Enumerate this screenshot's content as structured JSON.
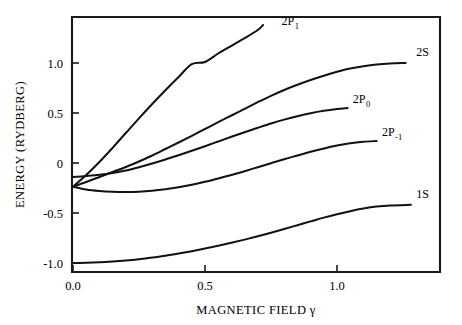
{
  "chart_data": {
    "type": "line",
    "title": "",
    "xlabel": "MAGNETIC FIELD  γ",
    "ylabel": "ENERGY (RYDBERG)",
    "xlim": [
      -0.03,
      1.39
    ],
    "ylim": [
      -1.09,
      1.47
    ],
    "xticks": [
      0.0,
      0.5,
      1.0
    ],
    "xtick_labels": [
      "0.0",
      "0.5",
      "1.0"
    ],
    "yticks": [
      -1.0,
      -0.5,
      0,
      0.5,
      1.0
    ],
    "ytick_labels": [
      "-1.0",
      "-0.5",
      "0",
      "0.5",
      "1.0"
    ],
    "grid": false,
    "legend": "none",
    "annotations": [
      {
        "text": "2P",
        "sub": "1",
        "x": 0.79,
        "y": 1.38
      },
      {
        "text": "2S",
        "sub": "",
        "x": 1.3,
        "y": 1.07
      },
      {
        "text": "2P",
        "sub": "0",
        "x": 1.06,
        "y": 0.6
      },
      {
        "text": "2P",
        "sub": "-1",
        "x": 1.17,
        "y": 0.27
      },
      {
        "text": "1S",
        "sub": "",
        "x": 1.3,
        "y": -0.35
      }
    ],
    "series": [
      {
        "name": "2P1",
        "label": "2P₁",
        "points": [
          [
            0.0,
            -0.237
          ],
          [
            0.05,
            -0.12
          ],
          [
            0.1,
            0.01
          ],
          [
            0.15,
            0.152
          ],
          [
            0.2,
            0.3
          ],
          [
            0.25,
            0.447
          ],
          [
            0.3,
            0.59
          ],
          [
            0.35,
            0.728
          ],
          [
            0.4,
            0.86
          ],
          [
            0.45,
            0.988
          ],
          [
            0.5,
            1.01
          ],
          [
            0.55,
            1.095
          ],
          [
            0.6,
            1.172
          ],
          [
            0.65,
            1.248
          ],
          [
            0.7,
            1.33
          ],
          [
            0.72,
            1.38
          ]
        ]
      },
      {
        "name": "2S",
        "label": "2S",
        "points": [
          [
            0.0,
            -0.237
          ],
          [
            0.05,
            -0.19
          ],
          [
            0.1,
            -0.14
          ],
          [
            0.15,
            -0.09
          ],
          [
            0.2,
            -0.04
          ],
          [
            0.25,
            0.015
          ],
          [
            0.3,
            0.075
          ],
          [
            0.35,
            0.14
          ],
          [
            0.4,
            0.205
          ],
          [
            0.45,
            0.272
          ],
          [
            0.5,
            0.34
          ],
          [
            0.55,
            0.408
          ],
          [
            0.6,
            0.475
          ],
          [
            0.65,
            0.542
          ],
          [
            0.7,
            0.608
          ],
          [
            0.75,
            0.672
          ],
          [
            0.8,
            0.73
          ],
          [
            0.85,
            0.782
          ],
          [
            0.9,
            0.83
          ],
          [
            0.95,
            0.873
          ],
          [
            1.0,
            0.912
          ],
          [
            1.05,
            0.945
          ],
          [
            1.1,
            0.968
          ],
          [
            1.15,
            0.985
          ],
          [
            1.2,
            0.995
          ],
          [
            1.26,
            1.0
          ]
        ]
      },
      {
        "name": "2P0",
        "label": "2P₀",
        "points": [
          [
            0.0,
            -0.14
          ],
          [
            0.05,
            -0.13
          ],
          [
            0.1,
            -0.118
          ],
          [
            0.15,
            -0.1
          ],
          [
            0.2,
            -0.075
          ],
          [
            0.25,
            -0.042
          ],
          [
            0.3,
            -0.005
          ],
          [
            0.35,
            0.035
          ],
          [
            0.4,
            0.078
          ],
          [
            0.45,
            0.122
          ],
          [
            0.5,
            0.168
          ],
          [
            0.55,
            0.215
          ],
          [
            0.6,
            0.262
          ],
          [
            0.65,
            0.308
          ],
          [
            0.7,
            0.352
          ],
          [
            0.75,
            0.395
          ],
          [
            0.8,
            0.434
          ],
          [
            0.85,
            0.468
          ],
          [
            0.9,
            0.498
          ],
          [
            0.95,
            0.522
          ],
          [
            1.0,
            0.54
          ],
          [
            1.04,
            0.55
          ]
        ]
      },
      {
        "name": "2P-1",
        "label": "2P₋₁",
        "points": [
          [
            0.0,
            -0.237
          ],
          [
            0.05,
            -0.265
          ],
          [
            0.1,
            -0.28
          ],
          [
            0.15,
            -0.288
          ],
          [
            0.2,
            -0.29
          ],
          [
            0.25,
            -0.287
          ],
          [
            0.3,
            -0.278
          ],
          [
            0.35,
            -0.263
          ],
          [
            0.4,
            -0.243
          ],
          [
            0.45,
            -0.218
          ],
          [
            0.5,
            -0.188
          ],
          [
            0.55,
            -0.155
          ],
          [
            0.6,
            -0.12
          ],
          [
            0.65,
            -0.082
          ],
          [
            0.7,
            -0.042
          ],
          [
            0.75,
            -0.002
          ],
          [
            0.8,
            0.038
          ],
          [
            0.85,
            0.075
          ],
          [
            0.9,
            0.112
          ],
          [
            0.95,
            0.145
          ],
          [
            1.0,
            0.175
          ],
          [
            1.05,
            0.198
          ],
          [
            1.1,
            0.212
          ],
          [
            1.15,
            0.22
          ]
        ]
      },
      {
        "name": "1S",
        "label": "1S",
        "points": [
          [
            0.0,
            -1.0
          ],
          [
            0.05,
            -0.998
          ],
          [
            0.1,
            -0.993
          ],
          [
            0.15,
            -0.985
          ],
          [
            0.2,
            -0.975
          ],
          [
            0.25,
            -0.962
          ],
          [
            0.3,
            -0.946
          ],
          [
            0.35,
            -0.928
          ],
          [
            0.4,
            -0.906
          ],
          [
            0.45,
            -0.882
          ],
          [
            0.5,
            -0.856
          ],
          [
            0.55,
            -0.828
          ],
          [
            0.6,
            -0.798
          ],
          [
            0.65,
            -0.766
          ],
          [
            0.7,
            -0.732
          ],
          [
            0.75,
            -0.697
          ],
          [
            0.8,
            -0.66
          ],
          [
            0.85,
            -0.622
          ],
          [
            0.9,
            -0.584
          ],
          [
            0.95,
            -0.546
          ],
          [
            1.0,
            -0.512
          ],
          [
            1.05,
            -0.482
          ],
          [
            1.1,
            -0.456
          ],
          [
            1.15,
            -0.436
          ],
          [
            1.2,
            -0.424
          ],
          [
            1.28,
            -0.418
          ]
        ]
      }
    ]
  }
}
